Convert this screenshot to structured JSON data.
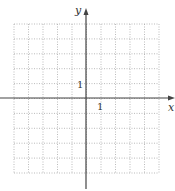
{
  "chart_data": {
    "type": "line",
    "title": "",
    "xlabel": "x",
    "ylabel": "y",
    "xlim": [
      -5,
      5
    ],
    "ylim": [
      -5,
      5
    ],
    "grid": true,
    "grid_style": "dotted",
    "tick_labels": {
      "x": [
        "1"
      ],
      "y": [
        "1"
      ]
    },
    "series": [],
    "colors": {
      "axis": "#444444",
      "grid": "#aaaaaa"
    }
  },
  "axes": {
    "x_label": "x",
    "y_label": "y",
    "x_tick": "1",
    "y_tick": "1"
  }
}
